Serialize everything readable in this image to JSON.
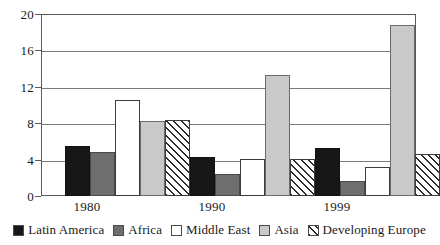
{
  "chart_data": {
    "type": "bar",
    "title": "",
    "subtitle": "",
    "xlabel": "",
    "ylabel": "",
    "categories": [
      "1980",
      "1990",
      "1999"
    ],
    "series": [
      {
        "name": "Latin America",
        "key": "latin",
        "color": "#171717",
        "fill": "solid-black",
        "values": [
          5.5,
          4.3,
          5.3
        ]
      },
      {
        "name": "Africa",
        "key": "africa",
        "color": "#6e6e6e",
        "fill": "solid-gray",
        "values": [
          4.8,
          2.4,
          1.6
        ]
      },
      {
        "name": "Middle East",
        "key": "mideast",
        "color": "#ffffff",
        "fill": "solid-white",
        "values": [
          10.6,
          4.1,
          3.2
        ]
      },
      {
        "name": "Asia",
        "key": "asia",
        "color": "#c9c9c9",
        "fill": "solid-light",
        "values": [
          8.3,
          13.3,
          18.8
        ]
      },
      {
        "name": "Developing Europe",
        "key": "deveur",
        "color": "#ffffff",
        "fill": "diagonal-hatch",
        "values": [
          8.4,
          4.05,
          4.6
        ]
      }
    ],
    "ylim": [
      0,
      20
    ],
    "yticks": [
      0,
      4,
      8,
      12,
      16,
      20
    ],
    "ytick_labels": [
      "0",
      "4",
      "8",
      "12",
      "16",
      "20"
    ],
    "grid": true,
    "grid_axis": "y",
    "legend_position": "bottom",
    "frame": true
  },
  "axes": {
    "y_labels": [
      "20",
      "16",
      "12",
      "8",
      "4",
      "0"
    ],
    "x_labels": [
      "1980",
      "1990",
      "1999"
    ]
  },
  "legend": {
    "items": [
      {
        "label": "Latin America"
      },
      {
        "label": "Africa"
      },
      {
        "label": "Middle East"
      },
      {
        "label": "Asia"
      },
      {
        "label": "Developing Europe"
      }
    ]
  },
  "style": {
    "axis_color": "#5a5a5a",
    "grid_color": "#7a7a7a",
    "text_color": "#1a1a1a",
    "background": "#ffffff"
  }
}
